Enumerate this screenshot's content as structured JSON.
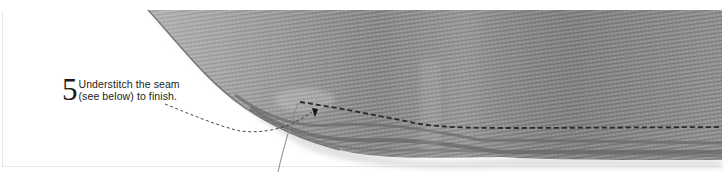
{
  "instruction": {
    "step_number": "5",
    "line1": "Understitch the seam",
    "line2": "(see below) to finish."
  },
  "illustration": {
    "subject": "fabric-seam-understitching-photo",
    "fabric_color": "#8a8a8a",
    "stitch_color": "#2a2a2a",
    "leader_line_color": "#444444"
  }
}
